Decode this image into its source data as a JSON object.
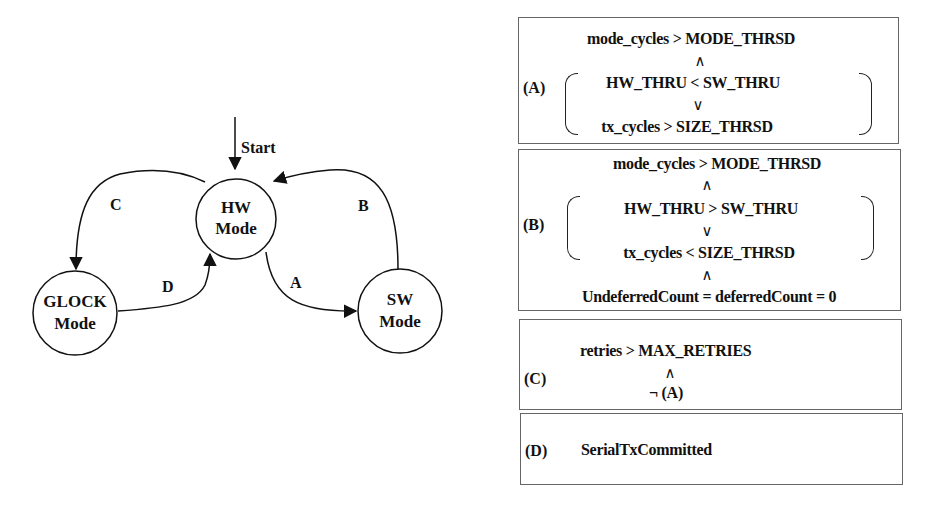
{
  "state_machine": {
    "start_label": "Start",
    "states": [
      {
        "id": "hw",
        "line1": "HW",
        "line2": "Mode"
      },
      {
        "id": "sw",
        "line1": "SW",
        "line2": "Mode"
      },
      {
        "id": "glock",
        "line1": "GLOCK",
        "line2": "Mode"
      }
    ],
    "transitions": [
      {
        "label": "A",
        "from": "HW Mode",
        "to": "SW Mode"
      },
      {
        "label": "B",
        "from": "SW Mode",
        "to": "HW Mode"
      },
      {
        "label": "C",
        "from": "HW Mode",
        "to": "GLOCK Mode"
      },
      {
        "label": "D",
        "from": "GLOCK Mode",
        "to": "HW Mode"
      }
    ]
  },
  "conditions": {
    "A": {
      "label": "(A)",
      "line1": "mode_cycles > MODE_THRSD",
      "op1": "∧",
      "line2": "HW_THRU < SW_THRU",
      "op2": "∨",
      "line3": "tx_cycles > SIZE_THRSD"
    },
    "B": {
      "label": "(B)",
      "line1": "mode_cycles > MODE_THRSD",
      "op1": "∧",
      "line2": "HW_THRU  > SW_THRU",
      "op2": "∨",
      "line3": "tx_cycles < SIZE_THRSD",
      "op3": "∧",
      "line4": "UndeferredCount = deferredCount = 0"
    },
    "C": {
      "label": "(C)",
      "line1": "retries > MAX_RETRIES",
      "op1": "∧",
      "line2": "¬ (A)"
    },
    "D": {
      "label": "(D)",
      "line1": "SerialTxCommitted"
    }
  }
}
